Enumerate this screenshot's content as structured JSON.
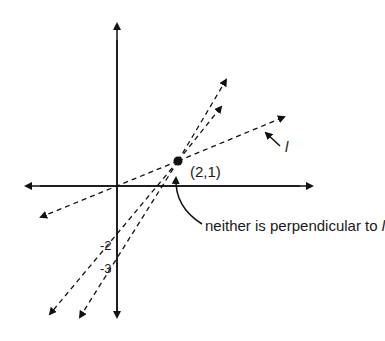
{
  "diagram": {
    "point_label": "(2,1)",
    "line_label": "l",
    "annotation_prefix": "neither is perpendicular to ",
    "annotation_var": "l",
    "y_intercept_labels": [
      "-2",
      "-3"
    ],
    "colors": {
      "ink": "#111111",
      "background": "#ffffff"
    },
    "elements": {
      "axes": [
        "x-axis",
        "y-axis"
      ],
      "point": {
        "x": 2,
        "y": 1
      },
      "lines": [
        {
          "name": "l",
          "style": "dashed",
          "through": [
            "origin",
            "(2,1)"
          ]
        },
        {
          "name": "line-through-y-int-minus-2",
          "style": "dashed",
          "through": [
            "(0,-2)",
            "(2,1)"
          ]
        },
        {
          "name": "line-through-y-int-minus-3",
          "style": "dashed",
          "through": [
            "(0,-3)",
            "(2,1)"
          ]
        }
      ]
    }
  }
}
